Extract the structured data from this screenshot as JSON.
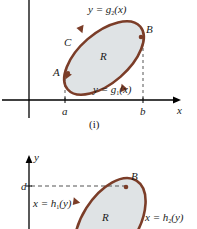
{
  "figure": {
    "type": "math-diagram",
    "colors": {
      "curve": "#7B3D28",
      "region_fill": "#DFE3E5",
      "axis": "#000000",
      "dashed": "#555555",
      "text": "#1a1a1a",
      "background": "#ffffff"
    }
  },
  "panel_one": {
    "caption": "(i)",
    "axes": {
      "x_axis_label": "x",
      "x_axis_y": 100,
      "y_axis_x": 29,
      "tick_labels": [
        "a",
        "b"
      ],
      "tick_a": "a",
      "tick_b": "b",
      "tick_a_x": 65,
      "tick_b_x": 143
    },
    "curve_labels": {
      "upper": "y = g",
      "upper_sub": "2",
      "upper_arg": "(x)",
      "lower": "y = g",
      "lower_sub": "1",
      "lower_arg": "(x)"
    },
    "point_labels": {
      "A": "A",
      "B": "B",
      "C": "C",
      "region": "R"
    }
  },
  "panel_two": {
    "axes": {
      "y_axis_label": "y",
      "y_axis_x": 29,
      "tick_label_d": "d",
      "tick_d_y": 186
    },
    "curve_labels": {
      "left": "x = h",
      "left_sub": "1",
      "left_arg": "(y)",
      "right": "x = h",
      "right_sub": "2",
      "right_arg": "(y)"
    },
    "point_labels": {
      "B": "B",
      "region": "R"
    }
  }
}
